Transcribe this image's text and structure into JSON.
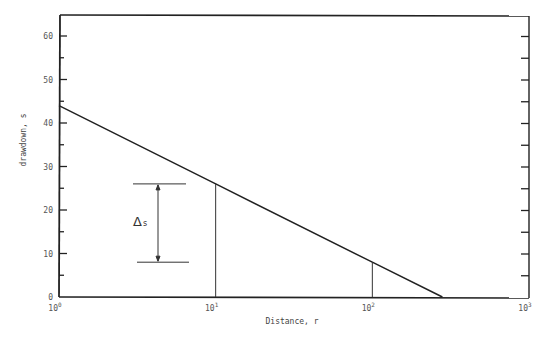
{
  "chart_data": {
    "type": "line",
    "title": "",
    "xlabel": "Distance, r",
    "ylabel": "drawdown, s",
    "x_scale": "log",
    "xlim": [
      1,
      1000
    ],
    "ylim": [
      0,
      65
    ],
    "x_ticks": [
      {
        "value": 1,
        "base": "10",
        "exp": "0"
      },
      {
        "value": 10,
        "base": "10",
        "exp": "1"
      },
      {
        "value": 100,
        "base": "10",
        "exp": "2"
      },
      {
        "value": 1000,
        "base": "10",
        "exp": "3"
      }
    ],
    "y_ticks": [
      0,
      10,
      20,
      30,
      40,
      50,
      60
    ],
    "y_minor_step": 5,
    "grid": false,
    "series": [
      {
        "name": "drawdown vs distance",
        "x": [
          1,
          10,
          100,
          280
        ],
        "y": [
          44,
          26,
          8,
          0
        ]
      }
    ],
    "annotations": [
      {
        "type": "vertical_line",
        "x": 10,
        "y_from": 0,
        "y_to": 26
      },
      {
        "type": "vertical_line",
        "x": 100,
        "y_from": 0,
        "y_to": 8
      },
      {
        "type": "dimension_bracket",
        "label": "Δs",
        "label_main": "Δ",
        "label_sub": "s",
        "y_top": 26,
        "y_bottom": 8,
        "x_center": 5.0
      }
    ]
  }
}
